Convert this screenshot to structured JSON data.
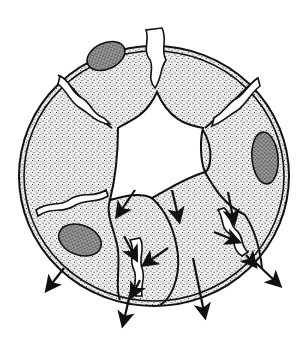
{
  "figure": {
    "type": "line-art illustration",
    "colors": {
      "background": "#ffffff",
      "ink": "#111111",
      "cytoplasm_fill": "#d9d9d9",
      "nucleus_fill": "#7a7a7a",
      "lumen": "#ffffff"
    },
    "components": {
      "outer_membrane": "double outer boundary",
      "cells": 6,
      "nuclei": 3,
      "intercellular_junctions": 5,
      "arrows": 12
    }
  }
}
